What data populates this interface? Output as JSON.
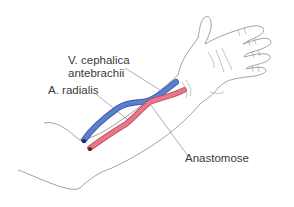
{
  "diagram": {
    "labels": {
      "vein_line1": "V. cephalica",
      "vein_line2": "antebrachii",
      "artery": "A. radialis",
      "anastomose": "Anastomose"
    },
    "colors": {
      "vein": "#4f74c4",
      "artery": "#e06a7e",
      "outline": "#8a8a8a",
      "skin": "#fdfcf5",
      "leader_line": "#7a7a7a",
      "text": "#3a3a3a"
    }
  }
}
